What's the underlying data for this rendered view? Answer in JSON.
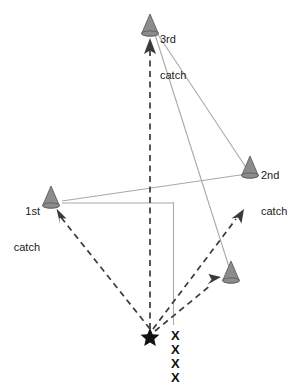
{
  "diagram": {
    "canvas": {
      "width": 297,
      "height": 385
    },
    "colors": {
      "cone_fill": "#8c8c8c",
      "cone_stroke": "#5a5a5a",
      "solid_line": "#a9a9a9",
      "dashed_line": "#3a3a3a",
      "text": "#1a1a1a",
      "background": "#ffffff"
    },
    "labels": [
      {
        "id": "third-catch",
        "line1": "3rd",
        "line2": "catch",
        "x": 160,
        "y": 10,
        "align": "left"
      },
      {
        "id": "second-catch",
        "line1": "2nd",
        "line2": "catch",
        "x": 261,
        "y": 145,
        "align": "left"
      },
      {
        "id": "first-catch",
        "line1": "1st",
        "line2": "catch",
        "x": 14,
        "y": 181,
        "align": "left"
      }
    ],
    "cones": [
      {
        "id": "cone-3rd-catch",
        "x": 150,
        "y": 34,
        "w": 17,
        "h": 21
      },
      {
        "id": "cone-2nd-catch",
        "x": 250,
        "y": 176,
        "w": 17,
        "h": 21
      },
      {
        "id": "cone-1st-catch",
        "x": 51,
        "y": 206,
        "w": 17,
        "h": 21
      },
      {
        "id": "cone-fourth",
        "x": 231,
        "y": 281,
        "w": 17,
        "h": 21
      }
    ],
    "solid_lines": [
      {
        "id": "line-3rd-to-2nd",
        "x1": 151,
        "y1": 24,
        "x2": 249,
        "y2": 172
      },
      {
        "id": "line-3rd-to-fourth",
        "x1": 152,
        "y1": 25,
        "x2": 230,
        "y2": 270
      },
      {
        "id": "line-2nd-to-1st",
        "x1": 247,
        "y1": 174,
        "x2": 62,
        "y2": 201
      },
      {
        "id": "line-1st-horizontal",
        "x1": 62,
        "y1": 203,
        "x2": 173,
        "y2": 203
      },
      {
        "id": "line-vertical-right",
        "x1": 173,
        "y1": 203,
        "x2": 173,
        "y2": 325
      }
    ],
    "dashed_lines": [
      {
        "id": "dash-star-to-1st",
        "x1": 150,
        "y1": 329,
        "x2": 57,
        "y2": 213
      },
      {
        "id": "dash-star-to-3rd",
        "x1": 150,
        "y1": 329,
        "x2": 150,
        "y2": 40
      },
      {
        "id": "dash-star-to-upper-right",
        "x1": 153,
        "y1": 329,
        "x2": 240,
        "y2": 212
      },
      {
        "id": "dash-star-to-fourth",
        "x1": 155,
        "y1": 330,
        "x2": 218,
        "y2": 279
      }
    ],
    "star": {
      "id": "start-point-star",
      "x": 150,
      "y": 335,
      "size": 13
    },
    "x_marks": [
      {
        "id": "x-mark-1",
        "label": "X",
        "x": 171,
        "y": 329
      },
      {
        "id": "x-mark-2",
        "label": "X",
        "x": 171,
        "y": 343
      },
      {
        "id": "x-mark-3",
        "label": "X",
        "x": 171,
        "y": 357
      },
      {
        "id": "x-mark-4",
        "label": "X",
        "x": 171,
        "y": 371
      }
    ]
  }
}
